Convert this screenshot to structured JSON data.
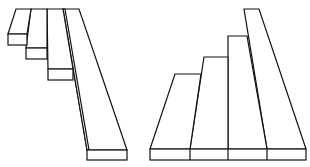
{
  "figure": {
    "background": "#ffffff",
    "stroke_color": "#111111",
    "left_figure": {
      "description": "four overlapping planks fanning down to the right from a shared top edge",
      "planks": [
        {
          "top": [
            [
              16,
              9
            ],
            [
              31,
              9
            ]
          ],
          "bottom_face": {
            "x": 8,
            "y": 34,
            "w": 19,
            "h": 11
          }
        },
        {
          "top": [
            [
              31,
              9
            ],
            [
              47,
              9
            ]
          ],
          "bottom_face": {
            "x": 26,
            "y": 48,
            "w": 21,
            "h": 11
          }
        },
        {
          "top": [
            [
              47,
              9
            ],
            [
              63,
              9
            ]
          ],
          "bottom_face": {
            "x": 48,
            "y": 69,
            "w": 25,
            "h": 11
          }
        },
        {
          "top": [
            [
              63,
              9
            ],
            [
              79,
              9
            ]
          ],
          "bottom_face": {
            "x": 87,
            "y": 150,
            "w": 40,
            "h": 10
          }
        }
      ]
    },
    "right_figure": {
      "description": "four planks of increasing height standing on a shared base, like a staircase",
      "base": {
        "x": 150,
        "y": 149,
        "w": 156,
        "h": 11,
        "dividers": [
          190,
          228,
          267
        ]
      },
      "steps": [
        {
          "top_y": 74,
          "x1": 175,
          "x2": 201
        },
        {
          "top_y": 57,
          "x1": 204,
          "x2": 228
        },
        {
          "top_y": 36,
          "x1": 228,
          "x2": 247
        },
        {
          "top_y": 9,
          "x1": 244,
          "x2": 259
        }
      ]
    }
  }
}
